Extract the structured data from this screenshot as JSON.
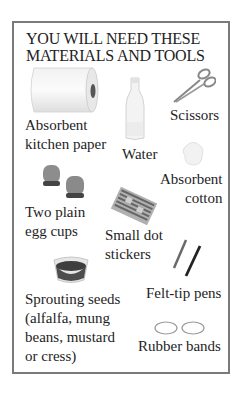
{
  "title": {
    "line1": "YOU WILL NEED THESE",
    "line2": "MATERIALS AND TOOLS"
  },
  "items": [
    {
      "id": "kitchen-paper",
      "lines": [
        "Absorbent",
        "kitchen paper"
      ],
      "icon": "paper-roll-icon"
    },
    {
      "id": "water",
      "lines": [
        "Water"
      ],
      "icon": "water-bottle-icon"
    },
    {
      "id": "scissors",
      "lines": [
        "Scissors"
      ],
      "icon": "scissors-icon"
    },
    {
      "id": "cotton",
      "lines": [
        "Absorbent",
        "cotton"
      ],
      "icon": "cotton-ball-icon"
    },
    {
      "id": "egg-cups",
      "lines": [
        "Two plain",
        "egg cups"
      ],
      "icon": "egg-cups-icon"
    },
    {
      "id": "dot-stickers",
      "lines": [
        "Small dot",
        "stickers"
      ],
      "icon": "dot-stickers-icon"
    },
    {
      "id": "seeds",
      "lines": [
        "Sprouting seeds",
        "(alfalfa, mung",
        "beans, mustard",
        "or cress)"
      ],
      "icon": "seed-bowl-icon"
    },
    {
      "id": "pens",
      "lines": [
        "Felt-tip pens"
      ],
      "icon": "felt-tip-pens-icon"
    },
    {
      "id": "bands",
      "lines": [
        "Rubber bands"
      ],
      "icon": "rubber-bands-icon"
    }
  ],
  "colors": {
    "border": "#7a7a7a",
    "text": "#1e1e1e",
    "background": "#ffffff"
  }
}
